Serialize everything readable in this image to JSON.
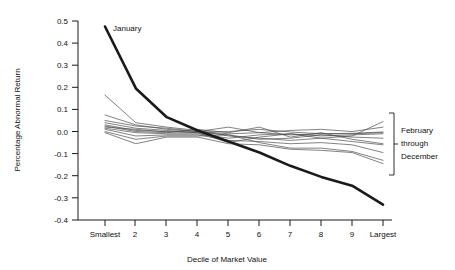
{
  "chart_data": {
    "type": "line",
    "title": "",
    "xlabel": "Decile of Market Value",
    "ylabel": "Percentage Abnormal Return",
    "categories": [
      "Smallest",
      "2",
      "3",
      "4",
      "5",
      "6",
      "7",
      "8",
      "9",
      "Largest"
    ],
    "x_tick_labels": [
      "Smallest",
      "2",
      "3",
      "4",
      "5",
      "6",
      "7",
      "8",
      "9",
      "Largest"
    ],
    "y_tick_labels": [
      "0.5",
      "0.4",
      "0.3",
      "0.2",
      "0.1",
      "0.0",
      "-0.1",
      "-0.2",
      "-0.3",
      "-0.4"
    ],
    "y_tick_values": [
      0.5,
      0.4,
      0.3,
      0.2,
      0.1,
      0.0,
      -0.1,
      -0.2,
      -0.3,
      -0.4
    ],
    "ylim": [
      -0.4,
      0.5
    ],
    "xlim": [
      1,
      10
    ],
    "grid": false,
    "legend_position": "right-bracket",
    "annotations": [
      {
        "name": "january-label",
        "text": "January"
      },
      {
        "name": "other-months-label",
        "text": "February\nthrough\nDecember"
      }
    ],
    "series": [
      {
        "name": "January",
        "emphasis": "bold",
        "color": "#1a1a1a",
        "values": [
          0.475,
          0.195,
          0.065,
          0.005,
          -0.045,
          -0.095,
          -0.155,
          -0.205,
          -0.245,
          -0.33
        ]
      },
      {
        "name": "February",
        "emphasis": "thin",
        "color": "#4d4d4d",
        "values": [
          0.165,
          0.04,
          0.02,
          0.005,
          -0.02,
          -0.03,
          -0.04,
          -0.03,
          -0.02,
          0.045
        ]
      },
      {
        "name": "March",
        "emphasis": "thin",
        "color": "#4d4d4d",
        "values": [
          0.075,
          0.03,
          0.01,
          0.0,
          0.02,
          -0.005,
          0.005,
          0.01,
          0.0,
          0.02
        ]
      },
      {
        "name": "April",
        "emphasis": "thin",
        "color": "#4d4d4d",
        "values": [
          0.05,
          0.025,
          0.015,
          0.0,
          -0.01,
          -0.005,
          -0.015,
          -0.01,
          -0.01,
          -0.005
        ]
      },
      {
        "name": "May",
        "emphasis": "thin",
        "color": "#4d4d4d",
        "values": [
          0.04,
          0.015,
          0.005,
          -0.005,
          -0.05,
          -0.025,
          -0.01,
          -0.02,
          -0.015,
          -0.01
        ]
      },
      {
        "name": "June",
        "emphasis": "thin",
        "color": "#4d4d4d",
        "values": [
          0.03,
          0.005,
          0.0,
          -0.005,
          -0.015,
          -0.035,
          -0.03,
          -0.015,
          -0.025,
          -0.03
        ]
      },
      {
        "name": "July",
        "emphasis": "thin",
        "color": "#4d4d4d",
        "values": [
          0.025,
          0.0,
          -0.005,
          0.01,
          -0.005,
          0.02,
          -0.025,
          -0.005,
          -0.035,
          -0.055
        ]
      },
      {
        "name": "August",
        "emphasis": "thin",
        "color": "#4d4d4d",
        "values": [
          0.015,
          -0.005,
          -0.01,
          -0.01,
          -0.03,
          -0.015,
          -0.01,
          -0.03,
          -0.045,
          -0.06
        ]
      },
      {
        "name": "September",
        "emphasis": "thin",
        "color": "#4d4d4d",
        "values": [
          0.01,
          -0.02,
          -0.015,
          -0.015,
          -0.04,
          -0.045,
          -0.055,
          -0.05,
          -0.06,
          -0.095
        ]
      },
      {
        "name": "October",
        "emphasis": "thin",
        "color": "#4d4d4d",
        "values": [
          0.0,
          -0.035,
          -0.02,
          -0.02,
          -0.015,
          -0.05,
          -0.075,
          -0.075,
          -0.09,
          -0.13
        ]
      },
      {
        "name": "November",
        "emphasis": "thin",
        "color": "#4d4d4d",
        "values": [
          -0.005,
          -0.055,
          -0.025,
          -0.025,
          -0.055,
          -0.06,
          -0.08,
          -0.085,
          -0.095,
          -0.145
        ]
      },
      {
        "name": "December",
        "emphasis": "thin",
        "color": "#4d4d4d",
        "values": [
          0.02,
          0.01,
          -0.002,
          -0.002,
          0.0,
          0.01,
          -0.002,
          -0.01,
          -0.008,
          -0.002
        ]
      }
    ]
  },
  "axes": {
    "y_label": "Percentage Abnormal Return",
    "x_label": "Decile of Market Value"
  },
  "labels": {
    "january": "January",
    "other_line1": "February",
    "other_line2": "through",
    "other_line3": "December"
  },
  "colors": {
    "january_line": "#1a1a1a",
    "other_lines": "#4d4d4d",
    "axis": "#1a1a1a",
    "background": "#ffffff"
  }
}
